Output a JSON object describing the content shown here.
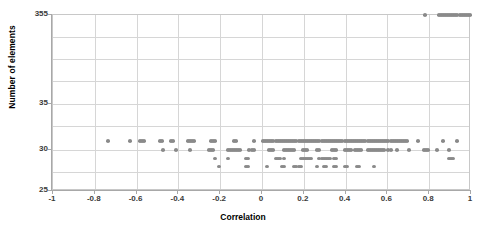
{
  "chart_data": {
    "type": "scatter",
    "title": "",
    "xlabel": "Correlation",
    "ylabel": "Number of elements",
    "xlim": [
      -1,
      1
    ],
    "xticks": [
      "-1",
      "-0.8",
      "-0.6",
      "-0.4",
      "-0.2",
      "0",
      "0.2",
      "0.4",
      "0.6",
      "0.8",
      "1"
    ],
    "xtick_values": [
      -1,
      -0.8,
      -0.6,
      -0.4,
      -0.2,
      0,
      0.2,
      0.4,
      0.6,
      0.8,
      1
    ],
    "yticks": [
      "355",
      "35",
      "30",
      "25"
    ],
    "ytick_values": [
      355,
      35,
      30,
      25
    ],
    "y_axis_note": "broken / non-linear axis: 25-35 lower region, 355 at top",
    "grid": true,
    "legend": false,
    "marker_color": "#8a8a8a",
    "marker_shape": "circle",
    "gridline_color": "#d6d6d6",
    "axis_color": "#a8a8a8",
    "series": [
      {
        "name": "elements-355",
        "y": 355,
        "x": [
          0.78,
          0.845,
          0.855,
          0.865,
          0.875,
          0.885,
          0.895,
          0.905,
          0.915,
          0.925,
          0.935,
          0.945,
          0.955,
          0.965,
          0.975,
          0.985,
          0.995
        ]
      },
      {
        "name": "elements-31",
        "y": 31,
        "x": [
          -0.735,
          -0.63,
          -0.585,
          -0.575,
          -0.565,
          -0.49,
          -0.48,
          -0.435,
          -0.425,
          -0.355,
          -0.345,
          -0.335,
          -0.325,
          -0.245,
          -0.235,
          -0.225,
          -0.135,
          -0.125,
          -0.04,
          0.005,
          0.015,
          0.025,
          0.035,
          0.045,
          0.055,
          0.065,
          0.075,
          0.085,
          0.095,
          0.105,
          0.115,
          0.125,
          0.135,
          0.145,
          0.155,
          0.165,
          0.175,
          0.185,
          0.195,
          0.205,
          0.215,
          0.225,
          0.235,
          0.245,
          0.255,
          0.265,
          0.275,
          0.285,
          0.295,
          0.305,
          0.315,
          0.325,
          0.335,
          0.345,
          0.355,
          0.365,
          0.375,
          0.385,
          0.395,
          0.405,
          0.415,
          0.425,
          0.435,
          0.445,
          0.455,
          0.465,
          0.475,
          0.485,
          0.495,
          0.505,
          0.515,
          0.525,
          0.535,
          0.545,
          0.555,
          0.565,
          0.575,
          0.585,
          0.595,
          0.605,
          0.615,
          0.625,
          0.635,
          0.645,
          0.655,
          0.665,
          0.675,
          0.685,
          0.695,
          0.745,
          0.865,
          0.935
        ]
      },
      {
        "name": "elements-30",
        "y": 30,
        "x": [
          -0.475,
          -0.41,
          -0.345,
          -0.255,
          -0.245,
          -0.235,
          -0.165,
          -0.155,
          -0.145,
          -0.135,
          -0.125,
          -0.115,
          -0.105,
          -0.06,
          -0.05,
          -0.04,
          0.035,
          0.045,
          0.055,
          0.105,
          0.115,
          0.125,
          0.135,
          0.145,
          0.155,
          0.195,
          0.205,
          0.215,
          0.265,
          0.275,
          0.335,
          0.345,
          0.355,
          0.395,
          0.405,
          0.415,
          0.425,
          0.445,
          0.455,
          0.465,
          0.475,
          0.505,
          0.515,
          0.525,
          0.535,
          0.545,
          0.555,
          0.565,
          0.575,
          0.585,
          0.605,
          0.615,
          0.645,
          0.705,
          0.775,
          0.785,
          0.795,
          0.835,
          0.895
        ]
      },
      {
        "name": "elements-29",
        "y": 29,
        "x": [
          -0.225,
          -0.165,
          -0.075,
          -0.065,
          0.065,
          0.075,
          0.085,
          0.105,
          0.185,
          0.195,
          0.205,
          0.215,
          0.225,
          0.235,
          0.275,
          0.285,
          0.295,
          0.305,
          0.315,
          0.325,
          0.345,
          0.355,
          0.895,
          0.905,
          0.915
        ]
      },
      {
        "name": "elements-28",
        "y": 28,
        "x": [
          -0.205,
          -0.075,
          -0.065,
          0.025,
          0.095,
          0.105,
          0.155,
          0.165,
          0.175,
          0.185,
          0.265,
          0.295,
          0.305,
          0.345,
          0.355,
          0.395,
          0.405,
          0.455,
          0.465,
          0.535
        ]
      }
    ]
  }
}
